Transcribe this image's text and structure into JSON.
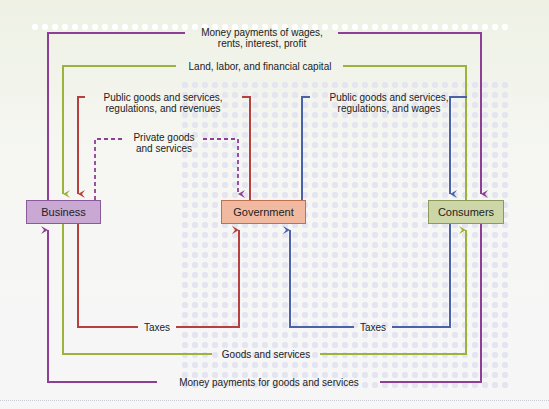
{
  "diagram": {
    "type": "circular-flow",
    "nodes": {
      "business": {
        "label": "Business",
        "fill": "#c9a8d4",
        "border": "#8a5a9a"
      },
      "government": {
        "label": "Government",
        "fill": "#f0b9a0",
        "border": "#c07050"
      },
      "consumers": {
        "label": "Consumers",
        "fill": "#cdd6a6",
        "border": "#8a9a5a"
      }
    },
    "flows": {
      "money_wages": {
        "label": "Money payments of wages,\nrents, interest, profit",
        "line1": "Money payments of wages,",
        "line2": "rents, interest, profit",
        "from": "Business",
        "to": "Consumers",
        "color": "#8e3f95"
      },
      "land_labor": {
        "label": "Land, labor, and financial capital",
        "from": "Consumers",
        "to": "Business",
        "color": "#9bb33a"
      },
      "public_goods_business": {
        "line1": "Public goods and services,",
        "line2": "regulations, and revenues",
        "from": "Government",
        "to": "Business",
        "color": "#b5403e"
      },
      "private_goods": {
        "line1": "Private goods",
        "line2": "and services",
        "from": "Business",
        "to": "Government",
        "color": "#8e3f95",
        "style": "dashed"
      },
      "public_goods_consumers": {
        "line1": "Public goods and services,",
        "line2": "regulations, and wages",
        "from": "Government",
        "to": "Consumers",
        "color": "#4a62a8"
      },
      "taxes_business": {
        "label": "Taxes",
        "from": "Business",
        "to": "Government",
        "color": "#b5403e"
      },
      "taxes_consumers": {
        "label": "Taxes",
        "from": "Consumers",
        "to": "Government",
        "color": "#4a62a8"
      },
      "goods_services": {
        "label": "Goods and services",
        "from": "Business",
        "to": "Consumers",
        "color": "#9bb33a"
      },
      "money_goods": {
        "label": "Money payments for goods and services",
        "from": "Consumers",
        "to": "Business",
        "color": "#8e3f95"
      }
    }
  }
}
